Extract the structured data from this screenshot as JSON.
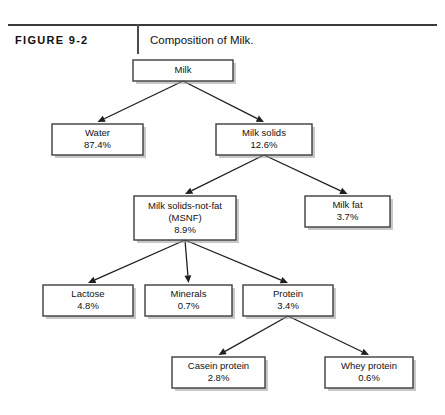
{
  "figure": {
    "label": "FIGURE 9-2",
    "caption": "Composition of Milk.",
    "rule_color": "#3a3a3a",
    "divider_color": "#4a4a4a"
  },
  "diagram": {
    "type": "tree-flowchart",
    "box_fill": "#ffffff",
    "box_stroke": "#3d3d3d",
    "shadow_color": "#9a9a9a",
    "arrow_color": "#1f1f1f",
    "nodes": [
      {
        "id": "milk",
        "name": "Milk",
        "value": "",
        "x": 133,
        "y": 60,
        "w": 100,
        "h": 21
      },
      {
        "id": "water",
        "name": "Water",
        "value": "87.4%",
        "x": 52,
        "y": 124,
        "w": 91,
        "h": 31
      },
      {
        "id": "solids",
        "name": "Milk solids",
        "value": "12.6%",
        "x": 216,
        "y": 124,
        "w": 96,
        "h": 31
      },
      {
        "id": "msnf",
        "name": "Milk solids-not-fat",
        "name2": "(MSNF)",
        "value": "8.9%",
        "x": 134,
        "y": 196,
        "w": 102,
        "h": 44
      },
      {
        "id": "fat",
        "name": "Milk fat",
        "value": "3.7%",
        "x": 305,
        "y": 196,
        "w": 85,
        "h": 31
      },
      {
        "id": "lactose",
        "name": "Lactose",
        "value": "4.8%",
        "x": 43,
        "y": 285,
        "w": 90,
        "h": 31
      },
      {
        "id": "minerals",
        "name": "Minerals",
        "value": "0.7%",
        "x": 145,
        "y": 285,
        "w": 87,
        "h": 31
      },
      {
        "id": "protein",
        "name": "Protein",
        "value": "3.4%",
        "x": 243,
        "y": 285,
        "w": 90,
        "h": 31
      },
      {
        "id": "casein",
        "name": "Casein protein",
        "value": "2.8%",
        "x": 172,
        "y": 357,
        "w": 93,
        "h": 31
      },
      {
        "id": "whey",
        "name": "Whey protein",
        "value": "0.6%",
        "x": 325,
        "y": 357,
        "w": 88,
        "h": 31
      }
    ],
    "edges": [
      {
        "from": "milk",
        "to": "water"
      },
      {
        "from": "milk",
        "to": "solids"
      },
      {
        "from": "solids",
        "to": "msnf"
      },
      {
        "from": "solids",
        "to": "fat"
      },
      {
        "from": "msnf",
        "to": "lactose"
      },
      {
        "from": "msnf",
        "to": "minerals"
      },
      {
        "from": "msnf",
        "to": "protein"
      },
      {
        "from": "protein",
        "to": "casein"
      },
      {
        "from": "protein",
        "to": "whey"
      }
    ]
  }
}
